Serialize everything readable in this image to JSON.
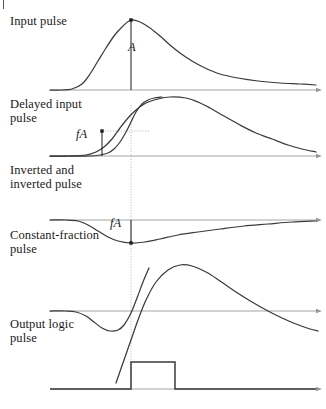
{
  "figure": {
    "width": 326,
    "height": 409,
    "background_color": "#ffffff",
    "curve_color": "#3a3a3a",
    "axis_color": "#9a9a9a",
    "annotation_color": "#1a1a1a",
    "guide_color": "#aaaaaa"
  },
  "rows": [
    {
      "id": "input-pulse",
      "label": "Input pulse",
      "label_x": 10,
      "label_y": 22,
      "baseline_y": 90,
      "axis_x_start": 50,
      "axis_x_end": 320
    },
    {
      "id": "delayed-input-pulse",
      "label": "Delayed input\npulse",
      "label_x": 10,
      "label_y": 97,
      "baseline_y": 156,
      "axis_x_start": 50,
      "axis_x_end": 320
    },
    {
      "id": "inverted-pulse",
      "label": "Inverted and\ninverted pulse",
      "label_x": 10,
      "label_y": 163,
      "baseline_y": 220,
      "axis_x_start": 50,
      "axis_x_end": 320
    },
    {
      "id": "constant-fraction-pulse",
      "label": "Constant-fraction\npulse",
      "label_x": 10,
      "label_y": 228,
      "baseline_y": 311,
      "axis_x_start": 50,
      "axis_x_end": 320
    },
    {
      "id": "output-logic-pulse",
      "label": "Output logic\npulse",
      "label_x": 10,
      "label_y": 322,
      "baseline_y": 389,
      "axis_x_start": 50,
      "axis_x_end": 320
    }
  ],
  "annotations": [
    {
      "id": "amplitude-a",
      "text": "A",
      "x": 128,
      "y": 47,
      "describes": "full pulse amplitude of input pulse",
      "arrow_x": 131,
      "arrow_top_y": 20,
      "arrow_bottom_y": 90
    },
    {
      "id": "fraction-a-delayed",
      "text": "fA",
      "x": 75,
      "y": 134,
      "describes": "fraction f of amplitude A on delayed input pulse",
      "arrow_x": 102,
      "arrow_top_y": 131,
      "arrow_bottom_y": 156
    },
    {
      "id": "fraction-a-constant",
      "text": "fA",
      "x": 110,
      "y": 223,
      "describes": "fraction f of amplitude A on constant-fraction pulse",
      "arrow_x": 131,
      "arrow_top_y": 220,
      "arrow_bottom_y": 243
    }
  ],
  "guides": {
    "zero_crossing_line": {
      "id": "zero-crossing-guide",
      "x": 131,
      "y_start": 105,
      "y_end": 383,
      "style": "dotted",
      "describes": "vertical dotted timing reference marking the zero-crossing instant"
    },
    "fraction_leader": {
      "id": "fraction-level-guide",
      "x_start": 102,
      "x_end": 150,
      "y": 131,
      "style": "dotted",
      "describes": "horizontal dotted level line at fA on the delayed pulse"
    }
  },
  "chart_data": {
    "type": "line",
    "xlabel": "",
    "ylabel": "",
    "grid": false,
    "legend": false,
    "series": [
      {
        "name": "Input pulse",
        "description": "Unipolar positive pulse of amplitude A, fast rise and slow exponential-like fall",
        "baseline_y": 90,
        "peak_x": 131,
        "peak_y": 20,
        "points": [
          [
            50,
            90
          ],
          [
            62,
            90
          ],
          [
            72,
            89
          ],
          [
            82,
            84
          ],
          [
            90,
            74
          ],
          [
            98,
            61
          ],
          [
            106,
            48
          ],
          [
            114,
            36
          ],
          [
            122,
            27
          ],
          [
            131,
            20
          ],
          [
            140,
            22
          ],
          [
            150,
            28
          ],
          [
            160,
            36
          ],
          [
            170,
            45
          ],
          [
            180,
            53
          ],
          [
            192,
            61
          ],
          [
            205,
            68
          ],
          [
            220,
            74
          ],
          [
            238,
            78
          ],
          [
            258,
            81
          ],
          [
            280,
            83
          ],
          [
            300,
            84
          ],
          [
            316,
            85
          ]
        ]
      },
      {
        "name": "Delayed input pulse",
        "description": "Same pulse shape delayed in time; crosses fraction level fA before the reference instant",
        "baseline_y": 156,
        "peak_x": 186,
        "peak_y": 98,
        "points": [
          [
            50,
            156
          ],
          [
            70,
            156
          ],
          [
            86,
            155
          ],
          [
            96,
            152
          ],
          [
            104,
            147
          ],
          [
            112,
            139
          ],
          [
            120,
            128
          ],
          [
            128,
            118
          ],
          [
            136,
            110
          ],
          [
            146,
            103
          ],
          [
            158,
            99
          ],
          [
            170,
            97
          ],
          [
            186,
            98
          ],
          [
            198,
            102
          ],
          [
            210,
            108
          ],
          [
            224,
            116
          ],
          [
            240,
            125
          ],
          [
            256,
            133
          ],
          [
            272,
            139
          ],
          [
            288,
            145
          ],
          [
            302,
            149
          ],
          [
            316,
            152
          ]
        ]
      },
      {
        "name": "Inverted and attenuated pulse",
        "description": "Attenuated copy of the input pulse, inverted; rises steeply through the fA level toward the reference instant",
        "baseline_y": 220,
        "points": [
          [
            50,
            156
          ],
          [
            74,
            156
          ],
          [
            90,
            156
          ],
          [
            100,
            155
          ],
          [
            108,
            153
          ],
          [
            114,
            149
          ],
          [
            120,
            142
          ],
          [
            126,
            132
          ],
          [
            131,
            122
          ],
          [
            136,
            112
          ],
          [
            142,
            104
          ],
          [
            148,
            100
          ],
          [
            154,
            98
          ],
          [
            162,
            97
          ]
        ]
      },
      {
        "name": "Constant-fraction pulse (bipolar sum)",
        "description": "Bipolar sum signal; dips to minimum fA below baseline then crosses zero at the reference instant",
        "baseline_y": 220,
        "zero_crossing_x": 131,
        "minimum_x": 131,
        "minimum_y": 243,
        "points": [
          [
            50,
            220
          ],
          [
            66,
            220
          ],
          [
            78,
            221
          ],
          [
            88,
            225
          ],
          [
            98,
            231
          ],
          [
            108,
            237
          ],
          [
            118,
            241
          ],
          [
            131,
            243
          ],
          [
            145,
            242
          ],
          [
            160,
            239
          ],
          [
            178,
            235
          ],
          [
            198,
            232
          ],
          [
            220,
            229
          ],
          [
            244,
            226
          ],
          [
            268,
            224
          ],
          [
            292,
            222
          ],
          [
            316,
            221
          ]
        ]
      },
      {
        "name": "Constant-fraction pulse positive lobe",
        "description": "Positive lobe of the bipolar constant-fraction output following the zero crossing",
        "baseline_y": 311,
        "points": [
          [
            116,
            383
          ],
          [
            124,
            360
          ],
          [
            131,
            340
          ],
          [
            138,
            320
          ],
          [
            146,
            300
          ],
          [
            156,
            282
          ],
          [
            168,
            270
          ],
          [
            180,
            265
          ],
          [
            192,
            266
          ],
          [
            206,
            272
          ],
          [
            220,
            281
          ],
          [
            236,
            292
          ],
          [
            252,
            302
          ],
          [
            268,
            311
          ],
          [
            282,
            318
          ],
          [
            296,
            324
          ],
          [
            310,
            329
          ],
          [
            318,
            331
          ]
        ]
      },
      {
        "name": "Zero-crossing trace",
        "description": "Trailing negative excursion crossing the baseline at the reference instant",
        "baseline_y": 311,
        "points": [
          [
            50,
            311
          ],
          [
            66,
            311
          ],
          [
            76,
            312
          ],
          [
            86,
            316
          ],
          [
            94,
            322
          ],
          [
            102,
            328
          ],
          [
            110,
            331
          ],
          [
            118,
            330
          ],
          [
            124,
            325
          ],
          [
            131,
            313
          ],
          [
            137,
            298
          ],
          [
            143,
            282
          ],
          [
            149,
            268
          ]
        ]
      },
      {
        "name": "Output logic pulse",
        "description": "Rectangular logic pulse generated at the zero crossing",
        "baseline_y": 389,
        "rise_x": 131,
        "fall_x": 175,
        "top_y": 362,
        "points": [
          [
            50,
            389
          ],
          [
            131,
            389
          ],
          [
            131,
            362
          ],
          [
            175,
            362
          ],
          [
            175,
            389
          ],
          [
            316,
            389
          ]
        ]
      }
    ]
  }
}
